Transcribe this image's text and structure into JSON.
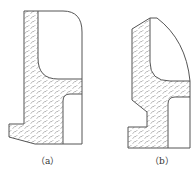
{
  "figures": [
    {
      "id": "a",
      "label": "（a）"
    },
    {
      "id": "b",
      "label": "（b）"
    }
  ],
  "colors": {
    "stroke": "#555555",
    "hatch": "#9a9a9a",
    "background": "#ffffff"
  }
}
